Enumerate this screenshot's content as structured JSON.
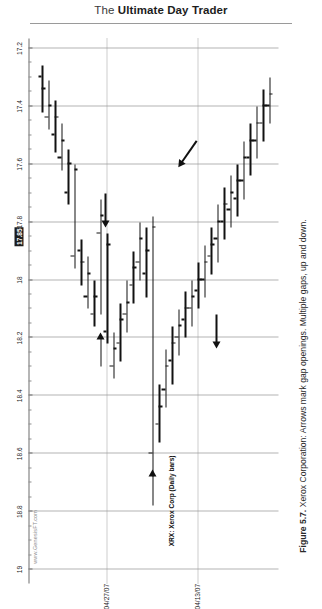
{
  "header": {
    "title_thin": "The ",
    "title_bold": "Ultimate Day Trader"
  },
  "figure": {
    "caption_number": "Figure 5.7.",
    "caption_text": " Xerox Corporation: Arrows mark gap openings. Multiple gaps, up and down."
  },
  "chart_panel": {
    "ticker_label": "XRX: Xerox Corp (Daily bars)",
    "watermark": "www.GenesisFT.com",
    "highlighted_price": "17.85"
  },
  "chart_data": {
    "type": "ohlc",
    "title": "XRX: Xerox Corp (Daily bars)",
    "xlabel": "",
    "ylabel": "",
    "orientation": "rotated-90",
    "grid": true,
    "legend_position": "none",
    "ylim": [
      17.2,
      19.0
    ],
    "price_ticks": [
      "19",
      "18.8",
      "18.6",
      "18.4",
      "18.2",
      "18",
      "17.8",
      "17.6",
      "17.4",
      "17.2"
    ],
    "price_tick_values": [
      19.0,
      18.8,
      18.6,
      18.4,
      18.2,
      18.0,
      17.8,
      17.6,
      17.4,
      17.2
    ],
    "date_ticks": [
      "04/27/07",
      "04/13/07"
    ],
    "current_price_marker": "17.85",
    "annotations": [
      {
        "name": "gap-arrow-1",
        "note": "arrow marks gap opening",
        "near_price": 18.55
      },
      {
        "name": "gap-arrow-2",
        "note": "arrow marks gap opening",
        "near_price": 18.05
      },
      {
        "name": "gap-arrow-3",
        "note": "arrow marks gap opening",
        "near_price": 17.95
      },
      {
        "name": "gap-arrow-4",
        "note": "arrow marks gap opening",
        "near_price": 17.75
      },
      {
        "name": "gap-arrow-5",
        "note": "arrow marks gap opening",
        "near_price": 17.62
      }
    ],
    "bars": [
      {
        "i": 0,
        "open": 17.34,
        "high": 17.42,
        "low": 17.26,
        "close": 17.3
      },
      {
        "i": 1,
        "open": 17.4,
        "high": 17.48,
        "low": 17.31,
        "close": 17.44
      },
      {
        "i": 2,
        "open": 17.44,
        "high": 17.56,
        "low": 17.38,
        "close": 17.5
      },
      {
        "i": 3,
        "open": 17.52,
        "high": 17.62,
        "low": 17.46,
        "close": 17.58
      },
      {
        "i": 4,
        "open": 17.6,
        "high": 17.74,
        "low": 17.55,
        "close": 17.7
      },
      {
        "i": 5,
        "open": 17.62,
        "high": 17.96,
        "low": 17.6,
        "close": 17.92
      },
      {
        "i": 6,
        "open": 17.94,
        "high": 18.02,
        "low": 17.86,
        "close": 17.9
      },
      {
        "i": 7,
        "open": 17.98,
        "high": 18.1,
        "low": 17.92,
        "close": 18.06
      },
      {
        "i": 8,
        "open": 18.06,
        "high": 18.16,
        "low": 18.0,
        "close": 18.12
      },
      {
        "i": 9,
        "open": 17.78,
        "high": 18.12,
        "low": 17.72,
        "close": 17.84
      },
      {
        "i": 10,
        "open": 17.88,
        "high": 18.22,
        "low": 17.84,
        "close": 18.18
      },
      {
        "i": 11,
        "open": 18.24,
        "high": 18.34,
        "low": 18.18,
        "close": 18.3
      },
      {
        "i": 12,
        "open": 18.14,
        "high": 18.28,
        "low": 18.08,
        "close": 18.22
      },
      {
        "i": 13,
        "open": 18.08,
        "high": 18.18,
        "low": 18.0,
        "close": 18.12
      },
      {
        "i": 14,
        "open": 17.96,
        "high": 18.08,
        "low": 17.9,
        "close": 18.02
      },
      {
        "i": 15,
        "open": 17.86,
        "high": 18.0,
        "low": 17.8,
        "close": 17.94
      },
      {
        "i": 16,
        "open": 17.9,
        "high": 18.06,
        "low": 17.82,
        "close": 17.98
      },
      {
        "i": 17,
        "open": 17.82,
        "high": 18.68,
        "low": 17.78,
        "close": 18.6
      },
      {
        "i": 18,
        "open": 18.44,
        "high": 18.56,
        "low": 18.36,
        "close": 18.5
      },
      {
        "i": 19,
        "open": 18.3,
        "high": 18.44,
        "low": 18.24,
        "close": 18.38
      },
      {
        "i": 20,
        "open": 18.22,
        "high": 18.36,
        "low": 18.16,
        "close": 18.28
      },
      {
        "i": 21,
        "open": 18.16,
        "high": 18.26,
        "low": 18.1,
        "close": 18.2
      },
      {
        "i": 22,
        "open": 18.1,
        "high": 18.2,
        "low": 18.04,
        "close": 18.14
      },
      {
        "i": 23,
        "open": 18.06,
        "high": 18.16,
        "low": 18.0,
        "close": 18.1
      },
      {
        "i": 24,
        "open": 18.0,
        "high": 18.1,
        "low": 17.94,
        "close": 18.04
      },
      {
        "i": 25,
        "open": 17.94,
        "high": 18.06,
        "low": 17.88,
        "close": 18.0
      },
      {
        "i": 26,
        "open": 17.88,
        "high": 17.98,
        "low": 17.82,
        "close": 17.92
      },
      {
        "i": 27,
        "open": 17.8,
        "high": 17.94,
        "low": 17.74,
        "close": 17.86
      },
      {
        "i": 28,
        "open": 17.74,
        "high": 17.86,
        "low": 17.68,
        "close": 17.8
      },
      {
        "i": 29,
        "open": 17.7,
        "high": 17.82,
        "low": 17.64,
        "close": 17.76
      },
      {
        "i": 30,
        "open": 17.66,
        "high": 17.78,
        "low": 17.6,
        "close": 17.72
      },
      {
        "i": 31,
        "open": 17.58,
        "high": 17.72,
        "low": 17.52,
        "close": 17.66
      },
      {
        "i": 32,
        "open": 17.52,
        "high": 17.64,
        "low": 17.46,
        "close": 17.58
      },
      {
        "i": 33,
        "open": 17.46,
        "high": 17.58,
        "low": 17.4,
        "close": 17.52
      },
      {
        "i": 34,
        "open": 17.4,
        "high": 17.52,
        "low": 17.34,
        "close": 17.46
      },
      {
        "i": 35,
        "open": 17.36,
        "high": 17.46,
        "low": 17.3,
        "close": 17.4
      }
    ]
  }
}
